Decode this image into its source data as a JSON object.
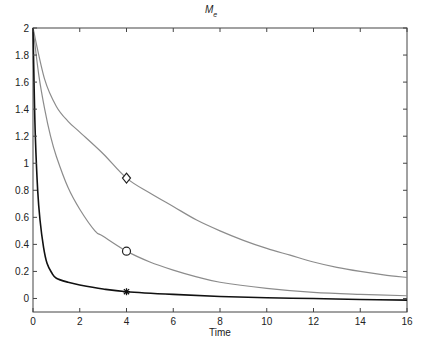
{
  "chart_data": {
    "type": "line",
    "title": "M",
    "title_subscript": "e",
    "xlabel": "Time",
    "ylabel": "",
    "xlim": [
      0,
      16
    ],
    "ylim": [
      -0.1,
      2
    ],
    "xticks": [
      0,
      2,
      4,
      6,
      8,
      10,
      12,
      14,
      16
    ],
    "yticks": [
      0,
      0.2,
      0.4,
      0.6,
      0.8,
      1,
      1.2,
      1.4,
      1.6,
      1.8,
      2
    ],
    "grid": false,
    "legend": null,
    "series": [
      {
        "name": "diamond",
        "color": "#8c8c8c",
        "marker": "diamond",
        "marker_at": [
          4,
          0.89
        ],
        "x": [
          0,
          0.5,
          1,
          1.5,
          2,
          3,
          4,
          5,
          6,
          7,
          8,
          9,
          10,
          11,
          12,
          13,
          14,
          15,
          16
        ],
        "y": [
          2,
          1.62,
          1.42,
          1.31,
          1.23,
          1.07,
          0.89,
          0.78,
          0.68,
          0.58,
          0.5,
          0.43,
          0.37,
          0.32,
          0.27,
          0.23,
          0.2,
          0.175,
          0.155
        ]
      },
      {
        "name": "circle",
        "color": "#8c8c8c",
        "marker": "circle",
        "marker_at": [
          4,
          0.35
        ],
        "x": [
          0,
          0.25,
          0.5,
          0.75,
          1,
          1.5,
          2,
          2.65,
          3,
          4,
          5,
          6,
          7,
          8,
          10,
          12,
          14,
          16
        ],
        "y": [
          2,
          1.65,
          1.4,
          1.2,
          1.05,
          0.82,
          0.66,
          0.5,
          0.46,
          0.35,
          0.27,
          0.21,
          0.16,
          0.12,
          0.075,
          0.045,
          0.03,
          0.02
        ]
      },
      {
        "name": "star",
        "color": "#111111",
        "marker": "star",
        "marker_at": [
          4,
          0.05
        ],
        "x": [
          0,
          0.05,
          0.1,
          0.2,
          0.3,
          0.45,
          0.6,
          0.8,
          1,
          1.5,
          2,
          3,
          4,
          6,
          8,
          10,
          12,
          14,
          16
        ],
        "y": [
          2,
          1.55,
          1.2,
          0.8,
          0.58,
          0.38,
          0.26,
          0.19,
          0.15,
          0.12,
          0.1,
          0.07,
          0.05,
          0.03,
          0.015,
          0.005,
          0.0,
          -0.008,
          -0.012
        ]
      }
    ]
  }
}
